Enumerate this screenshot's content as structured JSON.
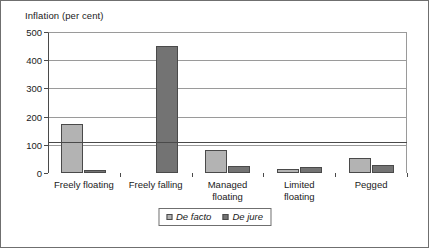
{
  "chart_data": {
    "type": "bar",
    "title": "Inflation (per cent)",
    "xlabel": "",
    "ylabel": "",
    "ylim": [
      0,
      500
    ],
    "yticks": [
      0,
      100,
      200,
      300,
      400,
      500
    ],
    "ytick_labels": [
      "0",
      "100",
      "200",
      "300",
      "400",
      "500"
    ],
    "grid": true,
    "legend_position": "bottom-center",
    "categories": [
      "Freely floating",
      "Freely falling",
      "Managed\nfloating",
      "Limited\nfloating",
      "Pegged"
    ],
    "series": [
      {
        "name": "De facto",
        "color": "#b3b3b3",
        "values": [
          175,
          0,
          80,
          15,
          52
        ]
      },
      {
        "name": "De jure",
        "color": "#737373",
        "values": [
          12,
          450,
          25,
          20,
          30
        ]
      }
    ]
  },
  "legend": {
    "entries": [
      {
        "label": "De facto"
      },
      {
        "label": "De jure"
      }
    ]
  },
  "colors": {
    "de_facto": "#b3b3b3",
    "de_jure": "#737373",
    "axis": "#4a4a4a",
    "grid": "#9a9a9a",
    "border": "#6f6f6f",
    "text": "#1a1a1a",
    "background": "#ffffff"
  }
}
